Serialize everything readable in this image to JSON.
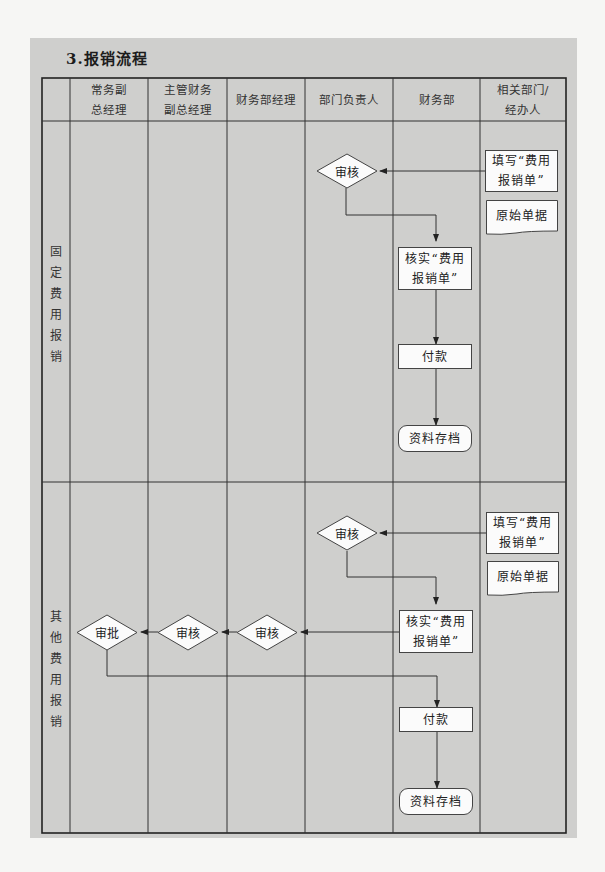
{
  "title": "3.报销流程",
  "header": {
    "columns": [
      "",
      "常务副\n总经理",
      "主管财务\n副总经理",
      "财务部经理",
      "部门负责人",
      "财务部",
      "相关部门/\n经办人"
    ]
  },
  "sections": [
    {
      "label": "固\n定\n费\n用\n报\n销",
      "nodes": {
        "fill_form": "填写“费用\n报销单”",
        "original_docs": "原始单据",
        "review": "审核",
        "verify": "核实“费用\n报销单”",
        "payment": "付款",
        "archive": "资料存档"
      }
    },
    {
      "label": "其\n他\n费\n用\n报\n销",
      "nodes": {
        "fill_form": "填写“费用\n报销单”",
        "original_docs": "原始单据",
        "review": "审核",
        "verify": "核实“费用\n报销单”",
        "finance_mgr_review": "审核",
        "vp_finance_review": "审核",
        "exec_vp_approve": "审批",
        "payment": "付款",
        "archive": "资料存档"
      }
    }
  ],
  "colors": {
    "panel": "#cfcfcd",
    "node_fill": "#fbfbfb",
    "line": "#333333"
  }
}
